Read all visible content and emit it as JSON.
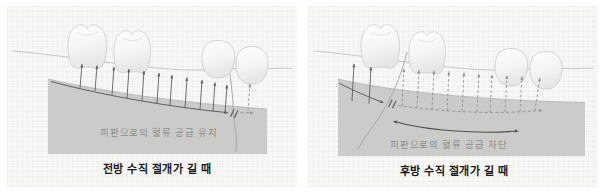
{
  "figure": {
    "type": "dental-flap-blood-supply-diagram",
    "colors": {
      "panel_bg": "#f7f7f5",
      "flap": "#cbcbc9",
      "solid_line": "#5f5f5d",
      "dashed_line": "#90908e",
      "flap_label": "#8d8d8b",
      "caption": "#1b1b1b"
    },
    "panels": [
      {
        "id": "anterior-vertical-incision-long",
        "flap_label": "피판으로의 혈류 공급 유지",
        "caption": "전방 수직 절개가 길 때",
        "blood_supply": "maintained",
        "cut_mark": "//",
        "arrows": {
          "solid": 11,
          "dashed": 1
        },
        "teeth": [
          "molar",
          "molar",
          "premolar",
          "canine"
        ]
      },
      {
        "id": "posterior-vertical-incision-long",
        "flap_label": "피판으로의 혈류 공급 차단",
        "caption": "후방 수직 절개가 길 때",
        "blood_supply": "blocked",
        "cut_mark": "//",
        "arrows": {
          "solid": 2,
          "dashed": 10
        },
        "teeth": [
          "molar",
          "molar",
          "premolar",
          "canine"
        ]
      }
    ]
  }
}
